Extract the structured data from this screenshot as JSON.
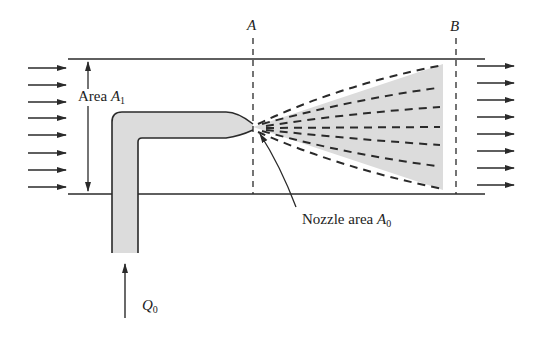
{
  "diagram": {
    "section_labels": {
      "a": "A",
      "b": "B"
    },
    "upstream_area": {
      "prefix": "Area ",
      "symbol": "A",
      "subscript": "1"
    },
    "nozzle_area": {
      "prefix": "Nozzle area ",
      "symbol": "A",
      "subscript": "0"
    },
    "flow_rate": {
      "symbol": "Q",
      "subscript": "0"
    },
    "inflow_arrow_count": 8,
    "outflow_arrow_count": 8,
    "jet_dashed_lines": 7,
    "colors": {
      "line": "#2a2a2a",
      "fill": "#d9d9d9"
    }
  }
}
